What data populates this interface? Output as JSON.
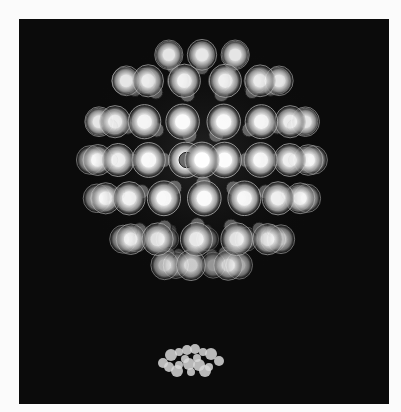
{
  "image": {
    "subject": "spherical light sculpture of clustered light bulbs",
    "background_color": "#0b0b0b",
    "page_color": "#fbfbfb",
    "sphere": {
      "cx": 183,
      "cy": 141,
      "r": 112
    },
    "reflection": {
      "cx": 172,
      "cy": 342,
      "rx": 34,
      "ry": 14
    }
  }
}
